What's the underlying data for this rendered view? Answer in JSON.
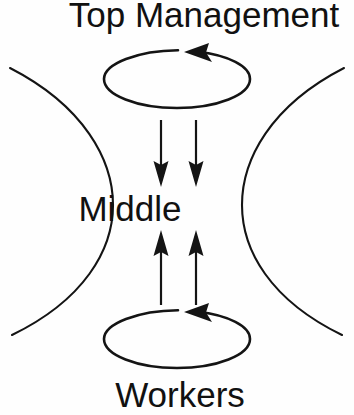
{
  "diagram": {
    "type": "organizational-feedback-loop",
    "background_color": "#fefefe",
    "stroke_color": "#141414",
    "text_color": "#111111",
    "labels": {
      "top": "Top Management",
      "middle": "Middle",
      "bottom": "Workers"
    },
    "nodes": [
      {
        "id": "top-management",
        "label": "Top Management",
        "x": 204,
        "y": 27
      },
      {
        "id": "middle",
        "label": "Middle",
        "x": 130,
        "y": 221
      },
      {
        "id": "workers",
        "label": "Workers",
        "x": 180,
        "y": 407
      }
    ],
    "loops": [
      {
        "id": "top-loop",
        "label": "Top Management circular feedback loop",
        "center_x": 177,
        "center_y": 79,
        "radius_x": 73,
        "radius_y": 29,
        "direction": "counter-clockwise",
        "arrow_direction": "left"
      },
      {
        "id": "bottom-loop",
        "label": "Workers circular feedback loop",
        "center_x": 177,
        "center_y": 339,
        "radius_x": 73,
        "radius_y": 29,
        "direction": "counter-clockwise",
        "arrow_direction": "left"
      }
    ],
    "arrows": [
      {
        "id": "down-arrow-left",
        "direction": "down",
        "x": 161,
        "y_start": 120,
        "y_end": 186,
        "from": "top-management",
        "to": "middle"
      },
      {
        "id": "down-arrow-right",
        "direction": "down",
        "x": 196,
        "y_start": 120,
        "y_end": 186,
        "from": "top-management",
        "to": "middle"
      },
      {
        "id": "up-arrow-left",
        "direction": "up",
        "x": 161,
        "y_start": 305,
        "y_end": 231,
        "from": "workers",
        "to": "middle"
      },
      {
        "id": "up-arrow-right",
        "direction": "up",
        "x": 196,
        "y_start": 305,
        "y_end": 231,
        "from": "workers",
        "to": "middle"
      }
    ],
    "arcs": [
      {
        "id": "left-arc",
        "side": "left",
        "bulge": "right",
        "x_start": 10,
        "y_start": 68,
        "x_end": 12,
        "y_end": 335,
        "apex_x": 113,
        "apex_y": 205
      },
      {
        "id": "right-arc",
        "side": "right",
        "bulge": "left",
        "x_start": 344,
        "y_start": 68,
        "x_end": 342,
        "y_end": 335,
        "apex_x": 242,
        "apex_y": 205
      }
    ]
  }
}
